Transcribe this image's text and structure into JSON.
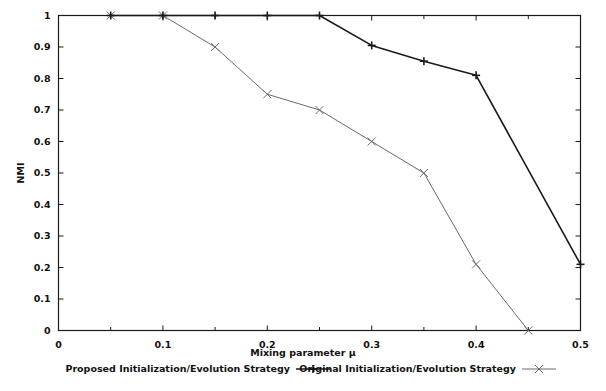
{
  "chart_data": {
    "type": "line",
    "title": "",
    "xlabel": "Mixing parameter μ",
    "ylabel": "NMI",
    "xlim": [
      0,
      0.5
    ],
    "ylim": [
      0,
      1
    ],
    "grid": false,
    "legend_position": "below-axis",
    "x_ticks": [
      "0",
      "0.1",
      "0.2",
      "0.3",
      "0.4",
      "0.5"
    ],
    "x_tick_values": [
      0,
      0.1,
      0.2,
      0.3,
      0.4,
      0.5
    ],
    "x_minor_tick_values": [
      0.05,
      0.15,
      0.25,
      0.35,
      0.45
    ],
    "y_ticks": [
      "0",
      "0.1",
      "0.2",
      "0.3",
      "0.4",
      "0.5",
      "0.6",
      "0.7",
      "0.8",
      "0.9",
      "1"
    ],
    "y_tick_values": [
      0,
      0.1,
      0.2,
      0.3,
      0.4,
      0.5,
      0.6,
      0.7,
      0.8,
      0.9,
      1
    ],
    "series": [
      {
        "name": "Proposed Initialization/Evolution Strategy",
        "marker": "plus",
        "color": "#1a1a1a",
        "line_width": 1.6,
        "x": [
          0.05,
          0.1,
          0.15,
          0.2,
          0.25,
          0.3,
          0.35,
          0.4,
          0.5
        ],
        "values": [
          1,
          1,
          1,
          1,
          1,
          0.905,
          0.855,
          0.81,
          0.21
        ]
      },
      {
        "name": "Original Initialization/Evolution Strategy",
        "marker": "cross",
        "color": "#6a6a6a",
        "line_width": 1.0,
        "x": [
          0.05,
          0.1,
          0.15,
          0.2,
          0.25,
          0.3,
          0.35,
          0.4,
          0.45
        ],
        "values": [
          1,
          1,
          0.9,
          0.75,
          0.7,
          0.6,
          0.5,
          0.21,
          0
        ]
      }
    ]
  },
  "legend": {
    "entries": [
      {
        "label": "Proposed Initialization/Evolution Strategy",
        "marker": "plus-marker"
      },
      {
        "label": "Original Initialization/Evolution Strategy",
        "marker": "cross-marker"
      }
    ]
  }
}
